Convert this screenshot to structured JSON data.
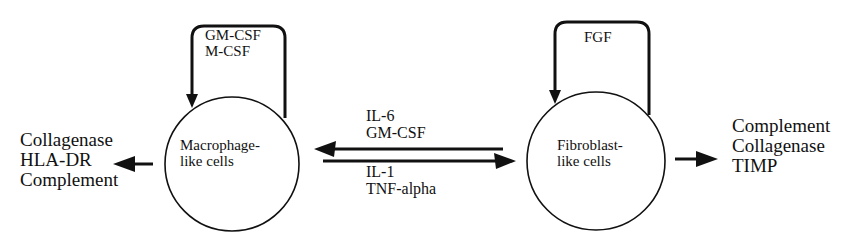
{
  "nodes": {
    "macrophage": {
      "line1": "Macrophage-",
      "line2": "like cells"
    },
    "fibroblast": {
      "line1": "Fibroblast-",
      "line2": "like cells"
    }
  },
  "loops": {
    "macrophage": {
      "line1": "GM-CSF",
      "line2": "M-CSF"
    },
    "fibroblast": {
      "line1": "FGF"
    }
  },
  "edges": {
    "fibroblast_to_macrophage": {
      "line1": "IL-6",
      "line2": "GM-CSF"
    },
    "macrophage_to_fibroblast": {
      "line1": "IL-1",
      "line2": "TNF-alpha"
    }
  },
  "outputs": {
    "macrophage": [
      "Collagenase",
      "HLA-DR",
      "Complement"
    ],
    "fibroblast": [
      "Complement",
      "Collagenase",
      "TIMP"
    ]
  },
  "colors": {
    "ink": "#111111",
    "background": "#ffffff"
  }
}
